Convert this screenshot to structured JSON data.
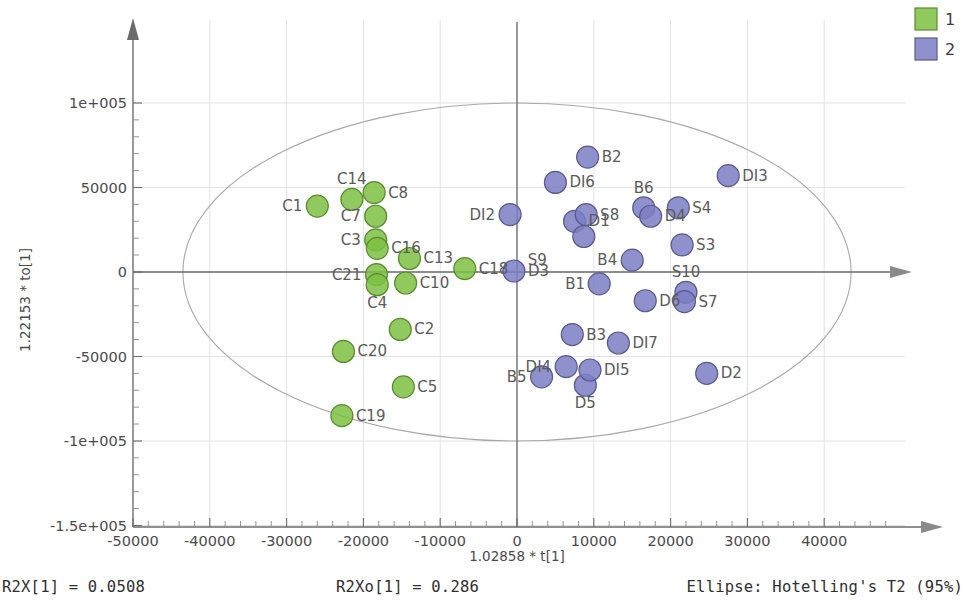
{
  "chart_data": {
    "type": "scatter",
    "title": "",
    "xlabel": "1.02858 * t[1]",
    "ylabel": "1.22153 * to[1]",
    "xlim": [
      -55000,
      47000
    ],
    "ylim": [
      -150000,
      125000
    ],
    "xticks": [
      -50000,
      -40000,
      -30000,
      -20000,
      -10000,
      0,
      10000,
      20000,
      30000,
      40000
    ],
    "xtick_labels": [
      "-50000",
      "-40000",
      "-30000",
      "-20000",
      "-10000",
      "0",
      "10000",
      "20000",
      "30000",
      "40000"
    ],
    "yticks": [
      100000,
      50000,
      0,
      -50000,
      -100000,
      -150000
    ],
    "ytick_labels": [
      "1e+005",
      "50000",
      "0",
      "-50000",
      "-1e+005",
      "-1.5e+005"
    ],
    "grid": true,
    "legend_position": "top-right",
    "ellipse": {
      "label": "Hotelling's T2 (95%)",
      "center_x": 0,
      "center_y": 0,
      "radius_x": 43500,
      "radius_y": 100000
    },
    "series": [
      {
        "name": "1",
        "color": "#7cc142",
        "points": [
          {
            "label": "C1",
            "x": -26000,
            "y": 39000
          },
          {
            "label": "C14",
            "x": -21500,
            "y": 43000
          },
          {
            "label": "C8",
            "x": -18600,
            "y": 47000
          },
          {
            "label": "C7",
            "x": -18400,
            "y": 33000
          },
          {
            "label": "C3",
            "x": -18400,
            "y": 19000
          },
          {
            "label": "C16",
            "x": -18200,
            "y": 14000
          },
          {
            "label": "C13",
            "x": -14000,
            "y": 8000
          },
          {
            "label": "C18",
            "x": -6800,
            "y": 2000
          },
          {
            "label": "C21",
            "x": -18300,
            "y": -1500
          },
          {
            "label": "C4",
            "x": -18200,
            "y": -7500
          },
          {
            "label": "C10",
            "x": -14500,
            "y": -6500
          },
          {
            "label": "C2",
            "x": -15200,
            "y": -34000
          },
          {
            "label": "C20",
            "x": -22600,
            "y": -47000
          },
          {
            "label": "C5",
            "x": -14800,
            "y": -68000
          },
          {
            "label": "C19",
            "x": -22800,
            "y": -85000
          }
        ]
      },
      {
        "name": "2",
        "color": "#7b7ec4",
        "points": [
          {
            "label": "B2",
            "x": 9200,
            "y": 68000
          },
          {
            "label": "DI6",
            "x": 5000,
            "y": 53000
          },
          {
            "label": "DI3",
            "x": 27500,
            "y": 57000
          },
          {
            "label": "B6",
            "x": 16500,
            "y": 38000
          },
          {
            "label": "S4",
            "x": 21000,
            "y": 38000
          },
          {
            "label": "DI2",
            "x": -900,
            "y": 34000
          },
          {
            "label": "D1",
            "x": 7500,
            "y": 30000
          },
          {
            "label": "S8",
            "x": 9000,
            "y": 34000
          },
          {
            "label": "D4",
            "x": 17400,
            "y": 33000
          },
          {
            "label": "B4",
            "x": 15000,
            "y": 7000
          },
          {
            "label": "S3",
            "x": 21500,
            "y": 16000
          },
          {
            "label": "D3",
            "x": -400,
            "y": 600
          },
          {
            "label": "S9",
            "x": 8700,
            "y": 21000
          },
          {
            "label": "B1",
            "x": 10700,
            "y": -7000
          },
          {
            "label": "S10",
            "x": 22000,
            "y": -12000
          },
          {
            "label": "D6",
            "x": 16700,
            "y": -17000
          },
          {
            "label": "S7",
            "x": 21800,
            "y": -17500
          },
          {
            "label": "B3",
            "x": 7200,
            "y": -37000
          },
          {
            "label": "DI7",
            "x": 13200,
            "y": -42000
          },
          {
            "label": "B5",
            "x": 3200,
            "y": -62000
          },
          {
            "label": "DI4",
            "x": 6400,
            "y": -56000
          },
          {
            "label": "D5",
            "x": 8900,
            "y": -67000
          },
          {
            "label": "DI5",
            "x": 9500,
            "y": -58000
          },
          {
            "label": "D2",
            "x": 24700,
            "y": -60000
          }
        ]
      }
    ],
    "footer": {
      "left": "R2X[1] = 0.0508",
      "center": "R2Xo[1] = 0.286",
      "right": "Ellipse: Hotelling's T2 (95%)"
    }
  },
  "legend": {
    "items": [
      {
        "label": "1",
        "color": "#7cc142"
      },
      {
        "label": "2",
        "color": "#7b7ec4"
      }
    ]
  }
}
